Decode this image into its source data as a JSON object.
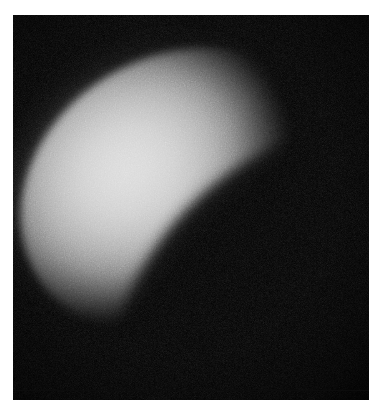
{
  "canvas": {
    "width": 374,
    "height": 417,
    "background_color": "#ffffff"
  },
  "image_frame": {
    "label": "observation-frame",
    "x": 13,
    "y": 15,
    "width": 356,
    "height": 385,
    "background_color": "#000000"
  },
  "subject": {
    "name": "illuminated-celestial-body",
    "description": "Bright grainy gibbous-phase disc",
    "shape": "ellipse",
    "rotation_deg": -31,
    "center_x": 178,
    "center_y": 190,
    "major_axis_px": 330,
    "minor_axis_px": 268,
    "peak_brightness_color": "#d8d8d8",
    "limb_color": "#9a9a9a",
    "shadow_color": "#000000",
    "terminator": "lower-right",
    "texture": "speckle-noise"
  },
  "chart_data": {
    "type": "heatmap",
    "title": "",
    "xlabel": "",
    "ylabel": "",
    "colormap": "grayscale",
    "value_range": [
      0,
      216
    ],
    "grid": false,
    "legend": "none"
  }
}
